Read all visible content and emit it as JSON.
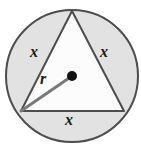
{
  "figure": {
    "type": "geometry-diagram",
    "canvas": {
      "width": 141,
      "height": 157,
      "background": "#ffffff"
    },
    "circle": {
      "name": "circumscribed-circle",
      "center_x": 72,
      "center_y": 76,
      "radius": 66,
      "fill": "#e2e2e2",
      "stroke": "#4d4d4d",
      "stroke_width": 2
    },
    "triangle": {
      "name": "inscribed-equilateral-triangle",
      "vertices": [
        {
          "label": "top",
          "x": 72,
          "y": 11
        },
        {
          "label": "bottom-right",
          "x": 124,
          "y": 111
        },
        {
          "label": "bottom-left",
          "x": 21,
          "y": 111
        }
      ],
      "fill": "#fcfcfc",
      "stroke": "#4d4d4d",
      "stroke_width": 2
    },
    "radius_segment": {
      "name": "radius-segment",
      "from_x": 21,
      "from_y": 111,
      "to_x": 72,
      "to_y": 76,
      "stroke": "#7a7a7a",
      "stroke_width": 3
    },
    "center_point": {
      "name": "center-point",
      "x": 72,
      "y": 76,
      "radius": 5,
      "fill": "#111111"
    },
    "labels": {
      "side_left": "x",
      "side_right": "x",
      "side_bottom": "x",
      "radius": "r"
    }
  }
}
